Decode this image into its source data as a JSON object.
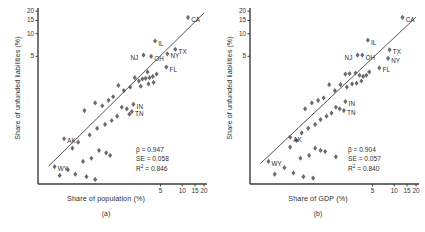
{
  "figure": {
    "panels": [
      {
        "id": "a",
        "caption": "(a)",
        "xlabel": "Share of population (%)",
        "ylabel": "Share of unfunded liabilities (%)",
        "stats": {
          "beta_label": "β = 0.947",
          "se_label": "SE = 0.058",
          "r2_label": "R",
          "r2_sup": "2",
          "r2_value": " = 0.846"
        }
      },
      {
        "id": "b",
        "caption": "(b)",
        "xlabel": "Share of GDP (%)",
        "ylabel": "Share of unfunded liabilities (%)",
        "stats": {
          "beta_label": "β = 0.904",
          "se_label": "SE = 0.057",
          "r2_label": "R",
          "r2_sup": "2",
          "r2_value": " = 0.840"
        }
      }
    ]
  },
  "chart_data": [
    {
      "type": "scatter",
      "panel": "(a)",
      "title": "",
      "xlabel": "Share of population (%)",
      "ylabel": "Share of unfunded liabilities (%)",
      "xscale": "log",
      "yscale": "log",
      "xticks": [
        5,
        10,
        15,
        20
      ],
      "yticks": [
        5,
        10,
        15,
        20
      ],
      "xlim": [
        0.1,
        22
      ],
      "ylim": [
        0.1,
        22
      ],
      "grid": false,
      "legend": null,
      "marker": "diamond",
      "marker_color": "#6b6b6b",
      "fit_line": {
        "slope": 0.947,
        "visible": true
      },
      "annotations": {
        "beta": 0.947,
        "SE": 0.058,
        "R2": 0.846
      },
      "points": [
        {
          "label": "CA",
          "x": 12.0,
          "y": 16.5,
          "label_pos": "right"
        },
        {
          "label": "IL",
          "x": 4.2,
          "y": 8.0,
          "label_pos": "right"
        },
        {
          "label": "NJ",
          "x": 2.9,
          "y": 5.2,
          "label_pos": "left"
        },
        {
          "label": "OH",
          "x": 3.7,
          "y": 5.0,
          "label_pos": "right"
        },
        {
          "label": "NY",
          "x": 6.2,
          "y": 5.4,
          "label_pos": "right"
        },
        {
          "label": "TX",
          "x": 8.0,
          "y": 6.2,
          "label_pos": "right"
        },
        {
          "label": "FL",
          "x": 6.0,
          "y": 3.6,
          "label_pos": "right"
        },
        {
          "label": "IN",
          "x": 2.1,
          "y": 1.15,
          "label_pos": "right"
        },
        {
          "label": "TN",
          "x": 2.0,
          "y": 0.92,
          "label_pos": "right"
        },
        {
          "label": "AK",
          "x": 0.23,
          "y": 0.4,
          "label_pos": "right"
        },
        {
          "label": "WY",
          "x": 0.17,
          "y": 0.17,
          "label_pos": "right"
        },
        {
          "label": "",
          "x": 3.3,
          "y": 3.1
        },
        {
          "label": "",
          "x": 2.2,
          "y": 2.6
        },
        {
          "label": "",
          "x": 2.5,
          "y": 2.35
        },
        {
          "label": "",
          "x": 2.8,
          "y": 2.5
        },
        {
          "label": "",
          "x": 3.1,
          "y": 2.55
        },
        {
          "label": "",
          "x": 3.5,
          "y": 2.6
        },
        {
          "label": "",
          "x": 3.9,
          "y": 2.7
        },
        {
          "label": "",
          "x": 4.4,
          "y": 2.9
        },
        {
          "label": "",
          "x": 4.0,
          "y": 2.25
        },
        {
          "label": "",
          "x": 3.4,
          "y": 2.15
        },
        {
          "label": "",
          "x": 2.65,
          "y": 2.0
        },
        {
          "label": "",
          "x": 1.9,
          "y": 1.95
        },
        {
          "label": "",
          "x": 1.55,
          "y": 1.75
        },
        {
          "label": "",
          "x": 1.3,
          "y": 2.05
        },
        {
          "label": "",
          "x": 1.1,
          "y": 1.45
        },
        {
          "label": "",
          "x": 0.95,
          "y": 1.3
        },
        {
          "label": "",
          "x": 0.78,
          "y": 1.1
        },
        {
          "label": "",
          "x": 0.62,
          "y": 1.2
        },
        {
          "label": "",
          "x": 1.45,
          "y": 1.05
        },
        {
          "label": "",
          "x": 1.7,
          "y": 1.0
        },
        {
          "label": "",
          "x": 1.85,
          "y": 0.85
        },
        {
          "label": "",
          "x": 1.25,
          "y": 0.8
        },
        {
          "label": "",
          "x": 1.05,
          "y": 0.7
        },
        {
          "label": "",
          "x": 0.85,
          "y": 0.62
        },
        {
          "label": "",
          "x": 0.66,
          "y": 0.55
        },
        {
          "label": "",
          "x": 0.52,
          "y": 0.45
        },
        {
          "label": "",
          "x": 0.44,
          "y": 0.95
        },
        {
          "label": "",
          "x": 0.36,
          "y": 0.36
        },
        {
          "label": "",
          "x": 0.3,
          "y": 0.3
        },
        {
          "label": "",
          "x": 0.7,
          "y": 0.28
        },
        {
          "label": "",
          "x": 0.88,
          "y": 0.26
        },
        {
          "label": "",
          "x": 1.0,
          "y": 0.24
        },
        {
          "label": "",
          "x": 0.55,
          "y": 0.22
        },
        {
          "label": "",
          "x": 0.42,
          "y": 0.2
        },
        {
          "label": "",
          "x": 0.26,
          "y": 0.155
        },
        {
          "label": "",
          "x": 0.33,
          "y": 0.135
        },
        {
          "label": "",
          "x": 0.47,
          "y": 0.125
        },
        {
          "label": "",
          "x": 0.2,
          "y": 0.13
        },
        {
          "label": "",
          "x": 0.62,
          "y": 0.115
        }
      ]
    },
    {
      "type": "scatter",
      "panel": "(b)",
      "title": "",
      "xlabel": "Share of GDP (%)",
      "ylabel": "Share of unfunded liabilities (%)",
      "xscale": "log",
      "yscale": "log",
      "xticks": [
        5,
        10,
        15,
        20
      ],
      "yticks": [
        5,
        10,
        15,
        20
      ],
      "xlim": [
        0.1,
        22
      ],
      "ylim": [
        0.1,
        22
      ],
      "grid": false,
      "legend": null,
      "marker": "diamond",
      "marker_color": "#6b6b6b",
      "fit_line": {
        "slope": 0.904,
        "visible": true
      },
      "annotations": {
        "beta": 0.904,
        "SE": 0.057,
        "R2": 0.84
      },
      "points": [
        {
          "label": "CA",
          "x": 13.0,
          "y": 16.5,
          "label_pos": "right"
        },
        {
          "label": "IL",
          "x": 4.3,
          "y": 8.2,
          "label_pos": "right"
        },
        {
          "label": "NJ",
          "x": 3.1,
          "y": 5.2,
          "label_pos": "left"
        },
        {
          "label": "OH",
          "x": 3.6,
          "y": 5.2,
          "label_pos": "right"
        },
        {
          "label": "NY",
          "x": 8.2,
          "y": 4.7,
          "label_pos": "right"
        },
        {
          "label": "TX",
          "x": 8.6,
          "y": 6.1,
          "label_pos": "right"
        },
        {
          "label": "FL",
          "x": 6.2,
          "y": 3.5,
          "label_pos": "right"
        },
        {
          "label": "IN",
          "x": 2.1,
          "y": 1.25,
          "label_pos": "right"
        },
        {
          "label": "TN",
          "x": 2.0,
          "y": 0.95,
          "label_pos": "right"
        },
        {
          "label": "AK",
          "x": 0.36,
          "y": 0.42,
          "label_pos": "right"
        },
        {
          "label": "WY",
          "x": 0.18,
          "y": 0.2,
          "label_pos": "right"
        },
        {
          "label": "",
          "x": 2.1,
          "y": 2.9
        },
        {
          "label": "",
          "x": 2.4,
          "y": 2.95
        },
        {
          "label": "",
          "x": 2.9,
          "y": 3.0
        },
        {
          "label": "",
          "x": 3.3,
          "y": 2.8
        },
        {
          "label": "",
          "x": 3.7,
          "y": 2.7
        },
        {
          "label": "",
          "x": 4.1,
          "y": 2.8
        },
        {
          "label": "",
          "x": 4.5,
          "y": 3.1
        },
        {
          "label": "",
          "x": 3.5,
          "y": 2.35
        },
        {
          "label": "",
          "x": 3.0,
          "y": 2.2
        },
        {
          "label": "",
          "x": 2.6,
          "y": 2.15
        },
        {
          "label": "",
          "x": 2.2,
          "y": 1.95
        },
        {
          "label": "",
          "x": 1.8,
          "y": 2.1
        },
        {
          "label": "",
          "x": 1.5,
          "y": 1.75
        },
        {
          "label": "",
          "x": 1.25,
          "y": 2.1
        },
        {
          "label": "",
          "x": 1.05,
          "y": 1.4
        },
        {
          "label": "",
          "x": 0.88,
          "y": 1.3
        },
        {
          "label": "",
          "x": 0.72,
          "y": 1.2
        },
        {
          "label": "",
          "x": 1.55,
          "y": 1.05
        },
        {
          "label": "",
          "x": 1.75,
          "y": 1.0
        },
        {
          "label": "",
          "x": 1.35,
          "y": 0.88
        },
        {
          "label": "",
          "x": 1.15,
          "y": 0.8
        },
        {
          "label": "",
          "x": 0.95,
          "y": 0.72
        },
        {
          "label": "",
          "x": 0.8,
          "y": 0.62
        },
        {
          "label": "",
          "x": 0.64,
          "y": 0.55
        },
        {
          "label": "",
          "x": 0.52,
          "y": 0.48
        },
        {
          "label": "",
          "x": 0.58,
          "y": 1.0
        },
        {
          "label": "",
          "x": 0.44,
          "y": 0.38
        },
        {
          "label": "",
          "x": 0.36,
          "y": 0.31
        },
        {
          "label": "",
          "x": 0.8,
          "y": 0.3
        },
        {
          "label": "",
          "x": 0.95,
          "y": 0.28
        },
        {
          "label": "",
          "x": 1.1,
          "y": 0.27
        },
        {
          "label": "",
          "x": 0.66,
          "y": 0.24
        },
        {
          "label": "",
          "x": 0.5,
          "y": 0.22
        },
        {
          "label": "",
          "x": 1.55,
          "y": 0.23
        },
        {
          "label": "",
          "x": 0.3,
          "y": 0.165
        },
        {
          "label": "",
          "x": 0.4,
          "y": 0.14
        },
        {
          "label": "",
          "x": 0.55,
          "y": 0.125
        },
        {
          "label": "",
          "x": 0.22,
          "y": 0.135
        },
        {
          "label": "",
          "x": 0.75,
          "y": 0.12
        }
      ]
    }
  ]
}
